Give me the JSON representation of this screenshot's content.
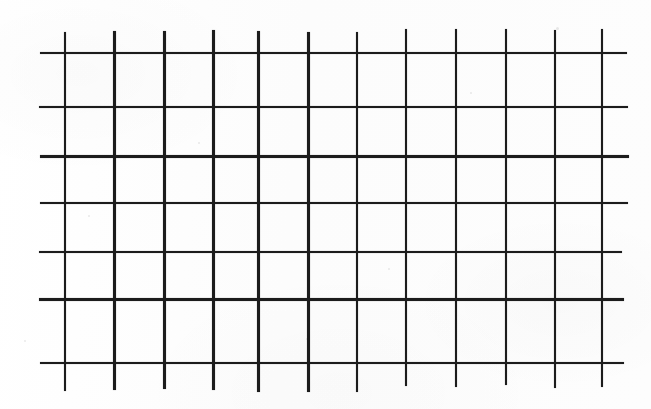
{
  "figure": {
    "type": "grid",
    "media": "scanned line drawing",
    "canvas": {
      "width": 651,
      "height": 409
    },
    "colors": {
      "background": "#fdfdfd",
      "line": "#1c1c1c",
      "paper_tint": "#ffffff"
    },
    "labels": {
      "caption": "",
      "axis_x": "",
      "axis_y": ""
    }
  },
  "chart_data": {
    "type": "grid",
    "title": "",
    "subtitle": "",
    "xlabel": "",
    "ylabel": "",
    "grid": true,
    "legend": null,
    "annotations": [],
    "tick_labels_x": [],
    "tick_labels_y": [],
    "counts": {
      "vertical_lines": 12,
      "horizontal_lines": 7,
      "cells_across": 11,
      "cells_down": 6
    },
    "vertical_lines_x": [
      64,
      114,
      164,
      213,
      258,
      308,
      357,
      407,
      457,
      506,
      555,
      603
    ],
    "horizontal_lines_y": [
      53,
      108,
      157,
      203,
      252,
      300,
      363
    ],
    "vertical_extent_y": [
      30,
      388
    ],
    "horizontal_extent_x": [
      42,
      628
    ],
    "column_widths": [
      50,
      50,
      49,
      45,
      50,
      49,
      50,
      50,
      49,
      49,
      48
    ],
    "row_heights": [
      55,
      49,
      46,
      49,
      48,
      63
    ],
    "line_width_px": 2.5,
    "xlim": [
      42,
      628
    ],
    "ylim": [
      30,
      388
    ]
  },
  "specks": [
    {
      "x": 88,
      "y": 215,
      "size": 2
    },
    {
      "x": 306,
      "y": 338,
      "size": 2
    },
    {
      "x": 470,
      "y": 92,
      "size": 2
    },
    {
      "x": 556,
      "y": 27,
      "size": 3
    },
    {
      "x": 24,
      "y": 340,
      "size": 2
    },
    {
      "x": 198,
      "y": 142,
      "size": 2
    },
    {
      "x": 388,
      "y": 268,
      "size": 2
    }
  ]
}
